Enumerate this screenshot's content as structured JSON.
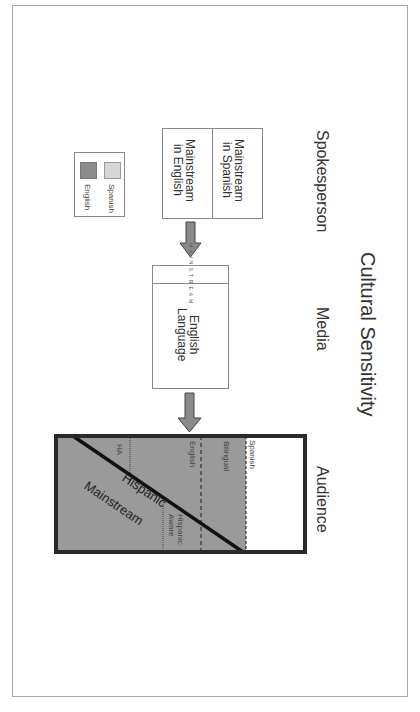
{
  "diagram": {
    "title": "Cultural Sensitivity",
    "columns": {
      "spokesperson": "Spokesperson",
      "media": "Media",
      "audience": "Audience"
    },
    "spokesperson_box": {
      "left": "Mainstream in Spanish",
      "left_line1": "Mainstream",
      "left_line2": "in Spanish",
      "right_line1": "Mainstream",
      "right_line2": "in English"
    },
    "media_box": {
      "strip_label": "MAINSTREAM",
      "line1": "English",
      "line2": "Language"
    },
    "audience_box": {
      "spanish": "Spanish",
      "bilingual": "Bilingual",
      "english": "English",
      "hispanic": "Hispanic",
      "ha": "HA",
      "mainstream": "Mainstream",
      "hispanic_aware_line1": "Hispanic",
      "hispanic_aware_line2": "Aware"
    },
    "legend": {
      "items": [
        {
          "label": "Spanish",
          "color": "#d6d6d6"
        },
        {
          "label": "English",
          "color": "#8c8c8c"
        }
      ]
    },
    "colors": {
      "english_fill": "#9a9a9a",
      "arrow_fill": "#8a8a8a",
      "box_border": "#2a2a2a"
    }
  }
}
